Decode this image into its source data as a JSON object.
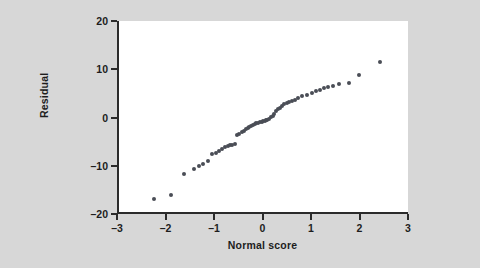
{
  "chart_data": {
    "type": "scatter",
    "title": "",
    "subtitle": "",
    "xlabel": "Normal score",
    "ylabel": "Residual",
    "xlim": [
      -3,
      3
    ],
    "ylim": [
      -20,
      20
    ],
    "xticks": [
      "-3",
      "-2",
      "-1",
      "0",
      "1",
      "2",
      "3"
    ],
    "xtick_values": [
      -3,
      -2,
      -1,
      0,
      1,
      2,
      3
    ],
    "yticks": [
      "20",
      "10",
      "0",
      "-10",
      "-20"
    ],
    "ytick_values": [
      20,
      10,
      0,
      -10,
      -20
    ],
    "grid": false,
    "legend": null,
    "marker_color": "#4a4d56",
    "plot_background": "#ffffff",
    "figure_background": "#d7d7d7",
    "axis_color": "#2b2b2b",
    "series": [
      {
        "name": "Residuals",
        "points": [
          [
            -2.28,
            -16.9
          ],
          [
            -1.93,
            -16.1
          ],
          [
            -1.66,
            -11.8
          ],
          [
            -1.46,
            -10.6
          ],
          [
            -1.36,
            -10.1
          ],
          [
            -1.26,
            -9.6
          ],
          [
            -1.17,
            -9.0
          ],
          [
            -1.08,
            -7.5
          ],
          [
            -1.01,
            -7.3
          ],
          [
            -0.94,
            -6.9
          ],
          [
            -0.88,
            -6.6
          ],
          [
            -0.82,
            -6.2
          ],
          [
            -0.76,
            -5.9
          ],
          [
            -0.71,
            -5.8
          ],
          [
            -0.66,
            -5.6
          ],
          [
            -0.61,
            -5.5
          ],
          [
            -0.56,
            -3.6
          ],
          [
            -0.52,
            -3.4
          ],
          [
            -0.47,
            -3.1
          ],
          [
            -0.43,
            -2.7
          ],
          [
            -0.39,
            -2.4
          ],
          [
            -0.35,
            -2.1
          ],
          [
            -0.31,
            -1.9
          ],
          [
            -0.27,
            -1.7
          ],
          [
            -0.24,
            -1.6
          ],
          [
            -0.2,
            -1.4
          ],
          [
            -0.17,
            -1.2
          ],
          [
            -0.13,
            -1.1
          ],
          [
            -0.1,
            -1.0
          ],
          [
            -0.06,
            -0.9
          ],
          [
            -0.03,
            -0.8
          ],
          [
            0.0,
            -0.7
          ],
          [
            0.03,
            -0.6
          ],
          [
            0.06,
            -0.5
          ],
          [
            0.1,
            -0.4
          ],
          [
            0.13,
            0.1
          ],
          [
            0.17,
            0.4
          ],
          [
            0.2,
            0.8
          ],
          [
            0.24,
            1.3
          ],
          [
            0.28,
            1.7
          ],
          [
            0.32,
            2.0
          ],
          [
            0.36,
            2.4
          ],
          [
            0.41,
            2.8
          ],
          [
            0.46,
            3.1
          ],
          [
            0.51,
            3.2
          ],
          [
            0.57,
            3.4
          ],
          [
            0.63,
            3.7
          ],
          [
            0.7,
            4.0
          ],
          [
            0.78,
            4.4
          ],
          [
            0.87,
            4.7
          ],
          [
            0.97,
            5.1
          ],
          [
            1.06,
            5.5
          ],
          [
            1.14,
            5.8
          ],
          [
            1.22,
            6.1
          ],
          [
            1.31,
            6.3
          ],
          [
            1.41,
            6.6
          ],
          [
            1.53,
            6.9
          ],
          [
            1.74,
            7.2
          ],
          [
            1.94,
            8.8
          ],
          [
            2.38,
            11.4
          ]
        ]
      }
    ]
  }
}
